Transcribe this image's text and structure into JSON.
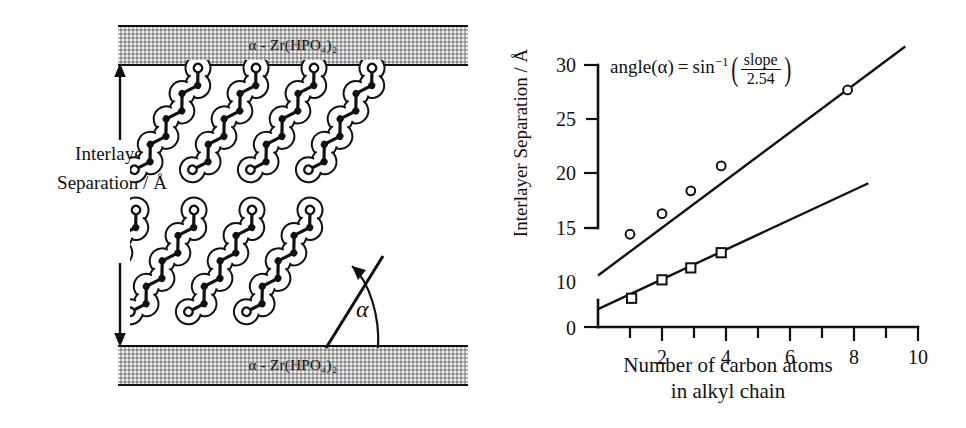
{
  "figure": {
    "left_panel": {
      "slab_top_label": "α - Zr(HPO₄)₂",
      "slab_bottom_label": "α - Zr(HPO₄)₂",
      "interlayer_label_line1": "Interlayer",
      "interlayer_label_line2": "Separation / Å",
      "angle_symbol": "α",
      "chain_count_rows": 2,
      "chain_count_per_row": 4
    },
    "right_panel": {
      "equation": {
        "lhs": "angle(α)",
        "equals": "=",
        "func": "sin",
        "exponent": "−1",
        "numerator": "slope",
        "denominator": "2.54"
      }
    }
  },
  "chart_data": {
    "type": "scatter",
    "title": "",
    "xlabel_line1": "Number of carbon atoms",
    "xlabel_line2": "in alkyl chain",
    "ylabel": "Interlayer Separation / Å",
    "xlim": [
      0,
      10
    ],
    "ylim": [
      0,
      30
    ],
    "y_axis_break": true,
    "y_break_between": [
      0,
      10
    ],
    "xticks": [
      1,
      2,
      3,
      4,
      5,
      6,
      7,
      8,
      9,
      10
    ],
    "xtick_labels": [
      "",
      "2",
      "",
      "4",
      "",
      "6",
      "",
      "8",
      "",
      "10"
    ],
    "yticks": [
      0,
      10,
      15,
      20,
      25,
      30
    ],
    "ytick_labels": [
      "0",
      "10",
      "15",
      "20",
      "25",
      "30"
    ],
    "grid": false,
    "legend": "none",
    "series": [
      {
        "name": "upper-series",
        "marker": "circle",
        "values": [
          {
            "x": 1.0,
            "y": 14.4
          },
          {
            "x": 2.0,
            "y": 16.3
          },
          {
            "x": 2.9,
            "y": 18.4
          },
          {
            "x": 3.85,
            "y": 20.7
          },
          {
            "x": 7.8,
            "y": 27.7
          }
        ],
        "fit_line": {
          "x0": 0.0,
          "y0": 10.6,
          "x1": 9.6,
          "y1": 31.7
        }
      },
      {
        "name": "lower-series",
        "marker": "square",
        "values": [
          {
            "x": 1.05,
            "y": 8.5
          },
          {
            "x": 2.0,
            "y": 10.2
          },
          {
            "x": 2.9,
            "y": 11.3
          },
          {
            "x": 3.85,
            "y": 12.7
          }
        ],
        "fit_line": {
          "x0": 0.0,
          "y0": 7.5,
          "x1": 8.45,
          "y1": 19.1
        }
      }
    ],
    "annotations": [
      {
        "text": "angle(α) = sin⁻¹(slope / 2.54)",
        "x": 3.0,
        "y": 30.5
      }
    ]
  }
}
